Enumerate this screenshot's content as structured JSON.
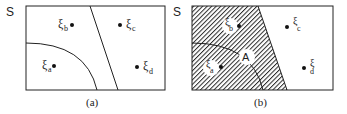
{
  "panels": [
    {
      "id": "a",
      "set_label": "S",
      "caption": "(a)",
      "points": [
        {
          "symbol": "ξ",
          "sub": "b"
        },
        {
          "symbol": "ξ",
          "sub": "c"
        },
        {
          "symbol": "ξ",
          "sub": "a"
        },
        {
          "symbol": "ξ",
          "sub": "d"
        }
      ]
    },
    {
      "id": "b",
      "set_label": "S",
      "caption": "(b)",
      "region_label": "A",
      "points": [
        {
          "symbol": "ξ",
          "sub": "b"
        },
        {
          "symbol": "ξ",
          "sub": "c"
        },
        {
          "symbol": "ξ",
          "sub": "a"
        },
        {
          "symbol": "ξ",
          "sub": "d"
        }
      ]
    }
  ],
  "colors": {
    "line": "#222222",
    "hatch": "#333333",
    "background": "#ffffff"
  }
}
